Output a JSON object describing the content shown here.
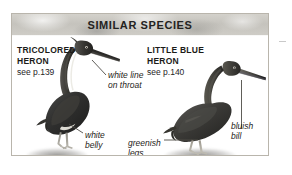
{
  "panel": {
    "header_title": "SIMILAR SPECIES"
  },
  "species": [
    {
      "id": "tricolored-heron",
      "name": "TRICOLORED\nHERON",
      "page_reference": "see p.139"
    },
    {
      "id": "little-blue-heron",
      "name": "LITTLE BLUE\nHERON",
      "page_reference": "see p.140"
    }
  ],
  "callouts": [
    {
      "id": "white-line-on-throat",
      "text": "white line\non throat",
      "species": "tricolored-heron"
    },
    {
      "id": "white-belly",
      "text": "white\nbelly",
      "species": "tricolored-heron"
    },
    {
      "id": "greenish-legs",
      "text": "greenish\nlegs",
      "species": "little-blue-heron"
    },
    {
      "id": "bluish-bill",
      "text": "bluish\nbill",
      "species": "little-blue-heron"
    }
  ],
  "colors": {
    "panel_border": "#b9b5ac",
    "header_band": "#c9c7c1",
    "title_text": "#24231f",
    "body_text": "#1c1b18",
    "leader_line": "#4e4c46",
    "page_background": "#ffffff"
  }
}
